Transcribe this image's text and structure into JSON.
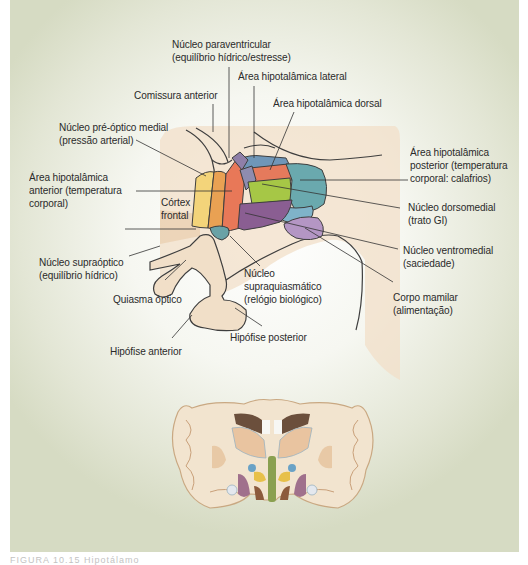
{
  "figure": {
    "labels": {
      "paraventricular": {
        "line1": "Núcleo paraventricular",
        "line2": "(equilíbrio hídrico/estresse)"
      },
      "lateral_area": {
        "line1": "Área hipotalâmica lateral"
      },
      "anterior_commissure": {
        "line1": "Comissura anterior"
      },
      "dorsal_area": {
        "line1": "Área hipotalâmica dorsal"
      },
      "medial_preoptic": {
        "line1": "Núcleo pré-óptico medial",
        "line2": "(pressão arterial)"
      },
      "posterior_area": {
        "line1": "Área hipotalâmica",
        "line2": "posterior (temperatura",
        "line3": "corporal: calafrios)"
      },
      "anterior_area": {
        "line1": "Área hipotalâmica",
        "line2": "anterior (temperatura",
        "line3": "corporal)"
      },
      "frontal_cortex": {
        "line1": "Córtex",
        "line2": "frontal"
      },
      "dorsomedial": {
        "line1": "Núcleo dorsomedial",
        "line2": "(trato GI)"
      },
      "supraoptic": {
        "line1": "Núcleo supraóptico",
        "line2": "(equilíbrio hídrico)"
      },
      "ventromedial": {
        "line1": "Núcleo ventromedial",
        "line2": "(saciedade)"
      },
      "suprachiasmatic": {
        "line1": "Núcleo",
        "line2": "supraquiasmático",
        "line3": "(relógio biológico)"
      },
      "optic_chiasm": {
        "line1": "Quiasma óptico"
      },
      "mammillary_body": {
        "line1": "Corpo mamilar",
        "line2": "(alimentação)"
      },
      "posterior_pituitary": {
        "line1": "Hipófise posterior"
      },
      "anterior_pituitary": {
        "line1": "Hipófise anterior"
      }
    },
    "colors": {
      "background_edge": "#d6dbc3",
      "tissue": "#f0dcc4",
      "tissue_dark": "#e6c6a2",
      "anterior_yellow": "#f3d47a",
      "anterior_orange": "#e9a153",
      "preoptic_red": "#e87858",
      "paraventricular_purple": "#8f7fa8",
      "dorsal_red": "#e57a5c",
      "posterior_teal": "#6aa9ae",
      "dorsomedial_green": "#a6c746",
      "ventromedial_purple": "#8a5e92",
      "mammillary_lilac": "#b496c4",
      "suprachiasmatic_teal": "#6aa2a6",
      "lateral_blue": "#6f96b8",
      "outline": "#3e3e3e"
    }
  },
  "caption": {
    "text": "FIGURA 10.15 Hipotálamo"
  }
}
